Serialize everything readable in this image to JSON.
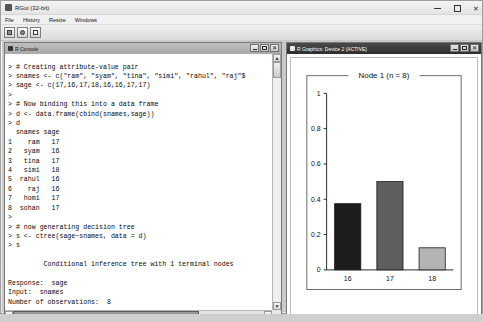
{
  "window": {
    "title": "RGui (32-bit)",
    "icon": "r-logo-icon",
    "controls": {
      "minimize": "–",
      "maximize": "❐",
      "close": "✕"
    }
  },
  "menubar": {
    "items": [
      {
        "label": "File"
      },
      {
        "label": "History"
      },
      {
        "label": "Resize"
      },
      {
        "label": "Windows"
      }
    ]
  },
  "toolbar": {
    "buttons": [
      {
        "name": "open-script-icon",
        "title": "Open script"
      },
      {
        "name": "load-workspace-icon",
        "title": "Load workspace"
      },
      {
        "name": "copy-paste-icon",
        "title": "Copy and paste"
      }
    ]
  },
  "console": {
    "title": "R Console",
    "icon": "console-icon",
    "controls": {
      "minimize": "–",
      "maximize": "❐",
      "close": "✕"
    },
    "text": "> # Creating attribute-value pair\n> snames <- c(\"ram\", \"syam\", \"tina\", \"simi\", \"rahul\", \"raj\"$\n> sage <- c(17,16,17,18,16,16,17,17)\n>\n> # Now binding this into a data frame\n> d <- data.frame(cbind(snames,sage))\n> d\n  snames sage\n1    ram   17\n2   syam   16\n3   tina   17\n4   simi   18\n5  rahul   16\n6    raj   16\n7   homi   17\n8  sohan   17\n>\n> # now generating decision tree\n> s <- ctree(sage~snames, data = d)\n> s\n\n         Conditional inference tree with 1 terminal nodes\n\nResponse:  sage\nInput:  snames\nNumber of observations:  8",
    "scroll_up_glyph": "▲",
    "scroll_down_glyph": "▼",
    "scroll_left_glyph": "◄",
    "scroll_right_glyph": "►"
  },
  "graphics": {
    "title": "R Graphics: Device 2 (ACTIVE)",
    "icon": "graphics-icon",
    "controls": {
      "minimize": "–",
      "maximize": "❐",
      "close": "✕"
    }
  },
  "chart_data": {
    "type": "bar",
    "title": "Node 1 (n = 8)",
    "categories": [
      "16",
      "17",
      "18"
    ],
    "values": [
      0.375,
      0.5,
      0.125
    ],
    "bar_colors": [
      "#1c1c1c",
      "#5e5e5e",
      "#b4b4b4"
    ],
    "xlabel": "",
    "ylabel": "",
    "ylim": [
      0,
      1
    ],
    "yticks": [
      "0",
      "0.2",
      "0.4",
      "0.6",
      "0.8",
      "1"
    ],
    "ytick_values": [
      0,
      0.2,
      0.4,
      0.6,
      0.8,
      1
    ],
    "grid": false,
    "legend": "none"
  }
}
